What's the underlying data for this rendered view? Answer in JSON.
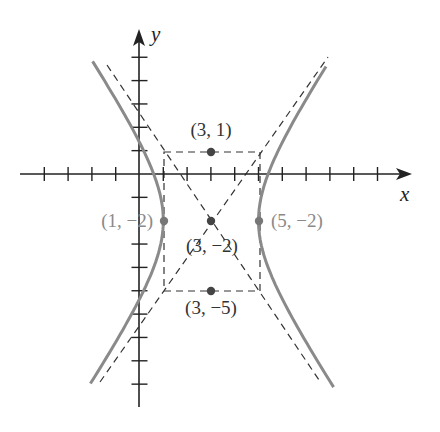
{
  "diagram": {
    "equation": "(x-3)^2/4 - (y+2)^2/9 = 1",
    "axes": {
      "x_label": "x",
      "y_label": "y",
      "x_ticks": [
        -4,
        -3,
        -2,
        -1,
        1,
        2,
        3,
        4,
        5,
        6,
        7,
        8,
        9,
        10
      ],
      "y_ticks": [
        -9,
        -8,
        -7,
        -6,
        -5,
        -4,
        -3,
        -2,
        -1,
        1,
        2,
        3,
        4,
        5
      ]
    },
    "points": [
      {
        "id": "top",
        "label": "(3, 1)",
        "x": 3,
        "y": 1
      },
      {
        "id": "center",
        "label": "(3, −2)",
        "x": 3,
        "y": -2
      },
      {
        "id": "left-vertex",
        "label": "(1, −2)",
        "x": 1,
        "y": -2
      },
      {
        "id": "right-vertex",
        "label": "(5, −2)",
        "x": 5,
        "y": -2
      },
      {
        "id": "bottom",
        "label": "(3, −5)",
        "x": 3,
        "y": -5
      }
    ],
    "box": {
      "x_min": 1,
      "x_max": 5,
      "y_min": -5,
      "y_max": 1
    },
    "asymptotes": [
      "y + 2 = (3/2)(x - 3)",
      "y + 2 = -(3/2)(x - 3)"
    ],
    "colors": {
      "axis": "#222222",
      "curve": "#8a8a8a",
      "dashed": "#333333",
      "point": "#444444",
      "label_dark": "#333333",
      "label_gray": "#8a8a8a"
    }
  }
}
